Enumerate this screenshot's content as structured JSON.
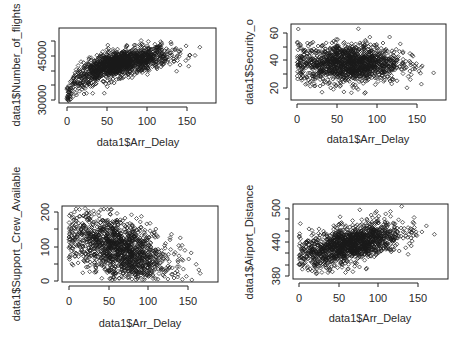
{
  "chart_data": [
    {
      "type": "scatter",
      "title": "",
      "xlabel": "data1$Arr_Delay",
      "ylabel": "data1$Number_of_flights",
      "x_ticks": [
        "0",
        "50",
        "100",
        "150"
      ],
      "y_ticks": [
        "30000",
        "45000"
      ],
      "xlim": [
        -5,
        185
      ],
      "ylim": [
        29000,
        55000
      ],
      "trend": "positive, concave (log-like) increase",
      "x_range_observed": [
        0,
        180
      ],
      "y_range_observed": [
        30000,
        54000
      ],
      "points_note": "several thousand points, dense cloud from (0,30000) rising to ~(130,48000), outliers up to (175,54000)"
    },
    {
      "type": "scatter",
      "title": "",
      "xlabel": "data1$Arr_Delay",
      "ylabel": "data1$Security_o",
      "x_ticks": [
        "0",
        "50",
        "100",
        "150"
      ],
      "y_ticks": [
        "20",
        "40",
        "60"
      ],
      "xlim": [
        -5,
        185
      ],
      "ylim": [
        12,
        65
      ],
      "trend": "no correlation; cloud centered around y=38",
      "x_range_observed": [
        0,
        180
      ],
      "y_range_observed": [
        14,
        64
      ],
      "points_note": "dense elliptical cloud x 0-150, y 22-55"
    },
    {
      "type": "scatter",
      "title": "",
      "xlabel": "data1$Arr_Delay",
      "ylabel": "data1$Support_Crew_Available",
      "x_ticks": [
        "0",
        "50",
        "100",
        "150"
      ],
      "y_ticks": [
        "0",
        "100",
        "200"
      ],
      "xlim": [
        -5,
        185
      ],
      "ylim": [
        -5,
        230
      ],
      "trend": "negative correlation",
      "x_range_observed": [
        0,
        180
      ],
      "y_range_observed": [
        0,
        225
      ],
      "points_note": "dense cloud high-left (~130 at x=10) decreasing to ~40 at x=150"
    },
    {
      "type": "scatter",
      "title": "",
      "xlabel": "data1$Arr_Delay",
      "ylabel": "data1$Airport_Distance",
      "x_ticks": [
        "0",
        "50",
        "100",
        "150"
      ],
      "y_ticks": [
        "380",
        "440",
        "500"
      ],
      "xlim": [
        -5,
        185
      ],
      "ylim": [
        375,
        505
      ],
      "trend": "positive correlation",
      "x_range_observed": [
        0,
        180
      ],
      "y_range_observed": [
        378,
        500
      ],
      "points_note": "dense cloud rising from ~415 at x=0 to ~465 at x=150"
    }
  ],
  "plots": [
    {
      "xlabel": "data1$Arr_Delay",
      "ylabel": "data1$Number_of_flights",
      "x_ticks": [
        "0",
        "50",
        "100",
        "150"
      ],
      "y_ticks": [
        "30000",
        "45000"
      ]
    },
    {
      "xlabel": "data1$Arr_Delay",
      "ylabel": "data1$Security_o",
      "x_ticks": [
        "0",
        "50",
        "100",
        "150"
      ],
      "y_ticks": [
        "20",
        "40",
        "60"
      ]
    },
    {
      "xlabel": "data1$Arr_Delay",
      "ylabel": "data1$Support_Crew_Available",
      "x_ticks": [
        "0",
        "50",
        "100",
        "150"
      ],
      "y_ticks": [
        "0",
        "100",
        "200"
      ]
    },
    {
      "xlabel": "data1$Arr_Delay",
      "ylabel": "data1$Airport_Distance",
      "x_ticks": [
        "0",
        "50",
        "100",
        "150"
      ],
      "y_ticks": [
        "380",
        "440",
        "500"
      ]
    }
  ],
  "colors": {
    "points": "#1a1a1a",
    "axes": "#222222",
    "background": "#ffffff"
  }
}
